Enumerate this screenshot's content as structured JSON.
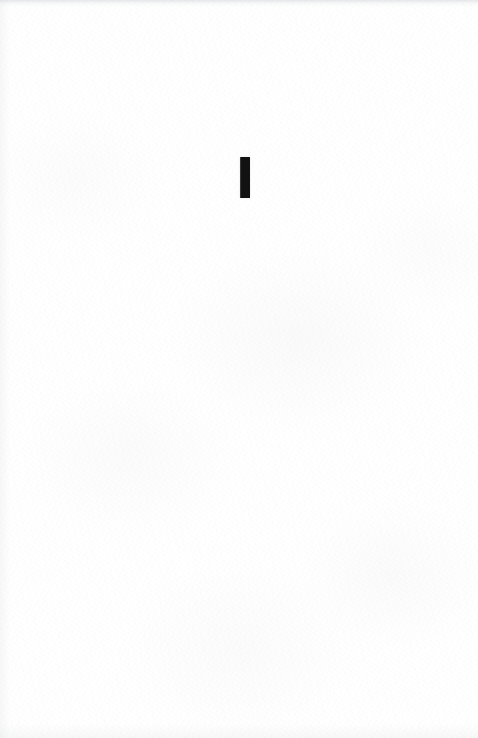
{
  "document": {
    "page_background_color": "#fdfdfd",
    "ink_color": "#121212",
    "page_width": 478,
    "page_height": 738,
    "body_text": "",
    "glyph": {
      "character": "I",
      "label": "isolated-bold-vertical-stroke",
      "x": 240,
      "y": 157,
      "width": 10,
      "height": 41
    }
  }
}
